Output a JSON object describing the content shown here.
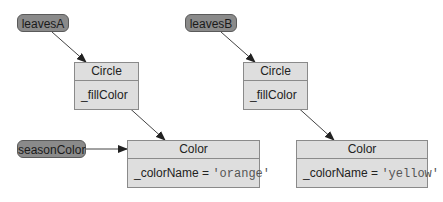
{
  "diagram": {
    "type": "object-reference-diagram",
    "variables": [
      {
        "id": "leavesA",
        "label": "leavesA"
      },
      {
        "id": "leavesB",
        "label": "leavesB"
      },
      {
        "id": "seasonColor",
        "label": "seasonColor"
      }
    ],
    "objects": [
      {
        "id": "circleA",
        "class": "Circle",
        "field": "_fillColor"
      },
      {
        "id": "circleB",
        "class": "Circle",
        "field": "_fillColor"
      },
      {
        "id": "colorA",
        "class": "Color",
        "field_name": "_colorName = ",
        "field_value": "'orange'"
      },
      {
        "id": "colorB",
        "class": "Color",
        "field_name": "_colorName = ",
        "field_value": "'yellow'"
      }
    ],
    "edges": [
      {
        "from": "leavesA",
        "to": "circleA"
      },
      {
        "from": "leavesB",
        "to": "circleB"
      },
      {
        "from": "circleA._fillColor",
        "to": "colorA"
      },
      {
        "from": "circleB._fillColor",
        "to": "colorB"
      },
      {
        "from": "seasonColor",
        "to": "colorA"
      }
    ],
    "colors": {
      "variable_fill": "#8a8a8a",
      "object_fill": "#dedede",
      "border": "#8a8a8a",
      "arrow": "#333333"
    }
  }
}
